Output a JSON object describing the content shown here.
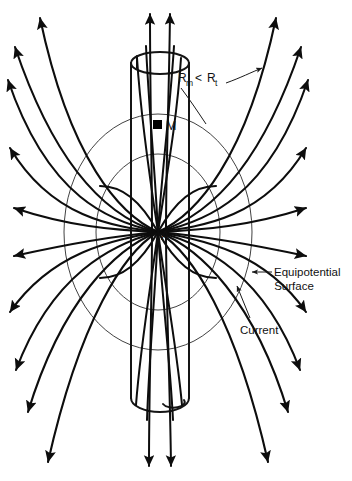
{
  "figure": {
    "kind": "physics-field-diagram",
    "background_color": "#ffffff",
    "line_color": "#0d0d0d",
    "equipotential_color": "#2b2b2b"
  },
  "labels": {
    "point_a": "A",
    "point_m": "M",
    "ratio_r1": "R",
    "ratio_sub1": "m",
    "ratio_operator": "<",
    "ratio_r2": "R",
    "ratio_sub2": "t",
    "equipotential_line1": "Equipotential",
    "equipotential_line2": "Surface",
    "current": "Current"
  },
  "annotations": {
    "equipotential_callout": "Equipotential Surface",
    "current_callout": "Current",
    "ratio_expression": "R_m < R_t"
  },
  "geometry": {
    "center_a": {
      "x": 158,
      "y": 232
    },
    "marker_m": {
      "x": 160,
      "y": 126
    },
    "cylinder": {
      "left_x": 131,
      "right_x": 189,
      "top_y": 52,
      "bottom_y": 412,
      "cap_rx": 29,
      "cap_ry": 11
    },
    "equipotential_outer": {
      "cx": 158,
      "cy": 232,
      "rx": 94,
      "ry": 118
    },
    "equipotential_inner": {
      "cx": 158,
      "cy": 232,
      "rx": 62,
      "ry": 78
    }
  }
}
